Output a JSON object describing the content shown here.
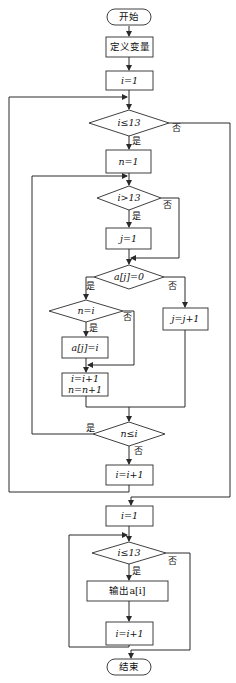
{
  "title": "",
  "nodes": {
    "start": "开始",
    "define_vars": "定义变量",
    "init_i": "i=1",
    "cond_i_le_13": "i≤13",
    "init_n": "n=1",
    "cond_i_gt_13": "i>13",
    "init_j": "j=1",
    "cond_aj_eq_0": "a[j]=0",
    "cond_n_eq_i": "n=i",
    "assign_aj_i": "a[j]=i",
    "incr_j": "j=j+1",
    "incr_i_line1": "i=i+1",
    "incr_i_line2": "n=n+1",
    "cond_n_le_i": "n≤i",
    "incr_i_outer": "i=i+1",
    "init_i_2": "i=1",
    "cond_i_le_13_2": "i≤13",
    "output_ai": "输出a[i]",
    "incr_i_2": "i=i+1",
    "end": "结束"
  },
  "labels": {
    "yes": "是",
    "no": "否"
  },
  "colors": {
    "stroke": "#2a2a2a",
    "background": "#ffffff"
  }
}
